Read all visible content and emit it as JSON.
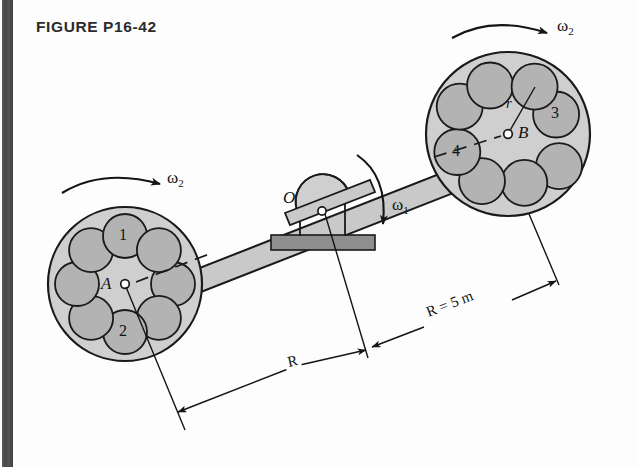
{
  "figure": {
    "title": "FIGURE P16-42",
    "background_color": "#fdfdfd",
    "ink_color": "#141414"
  },
  "colors": {
    "disk_fill": "#cfcfcf",
    "hole_fill": "#b3b3b3",
    "bar_fill": "#c9c9c9",
    "base_fill": "#8e8e8e",
    "outline": "#1a1a1a",
    "scan_edge": "#4a4a4a"
  },
  "labels": {
    "omega_1": "ω",
    "omega_1_sub": "1",
    "omega_2_left": "ω",
    "omega_2_left_sub": "2",
    "omega_2_right": "ω",
    "omega_2_right_sub": "2",
    "point_a": "A",
    "point_b": "B",
    "point_o": "O",
    "radius_r": "r",
    "hole_1": "1",
    "hole_2": "2",
    "hole_3": "3",
    "hole_4": "4",
    "dim_left": "R",
    "dim_right": "R = 5 m"
  },
  "geometry": {
    "left_disk": {
      "cx": 125,
      "cy": 284,
      "r": 77,
      "hole_r": 22,
      "hole_ring_r": 48,
      "hole_count": 8
    },
    "right_disk": {
      "cx": 508,
      "cy": 134,
      "r": 82,
      "hole_r": 23,
      "hole_ring_r": 51,
      "hole_count": 8
    },
    "pivot": {
      "x": 322,
      "y": 211
    },
    "bar_angle_deg": -21.4
  },
  "annotations": {
    "numbered_holes": [
      {
        "label": "1",
        "disk": "left",
        "index": 6
      },
      {
        "label": "2",
        "disk": "left",
        "index": 3
      },
      {
        "label": "3",
        "disk": "right",
        "index": 0
      },
      {
        "label": "4",
        "disk": "right",
        "index": 4
      }
    ]
  }
}
